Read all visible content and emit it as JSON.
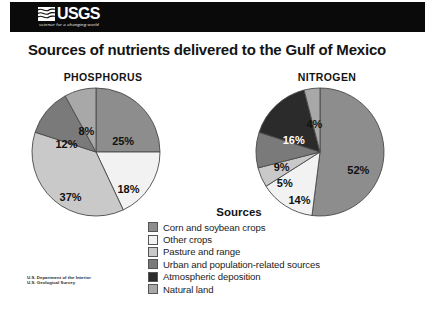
{
  "header": {
    "wordmark": "USGS",
    "tagline": "science for a changing world",
    "logo_icon": "usgs-wave-icon",
    "bar_color": "#0a0a0a"
  },
  "title": "Sources of nutrients delivered to the Gulf of Mexico",
  "legend": {
    "title": "Sources",
    "items": [
      {
        "label": "Corn and soybean crops",
        "color": "#8d8d8d"
      },
      {
        "label": "Other crops",
        "color": "#f2f2f2"
      },
      {
        "label": "Pasture and range",
        "color": "#c9c9c9"
      },
      {
        "label": "Urban and population-related sources",
        "color": "#7a7a7a"
      },
      {
        "label": "Atmospheric deposition",
        "color": "#2b2b2b"
      },
      {
        "label": "Natural land",
        "color": "#a8a8a8"
      }
    ]
  },
  "footer": {
    "line1": "U.S. Department of the Interior",
    "line2": "U.S. Geological Survey"
  },
  "chart_data": [
    {
      "type": "pie",
      "title": "PHOSPHORUS",
      "categories": [
        "Corn and soybean crops",
        "Other crops",
        "Pasture and range",
        "Urban and population-related sources",
        "Atmospheric deposition"
      ],
      "values": [
        25,
        18,
        37,
        12,
        8
      ],
      "labels": [
        "25%",
        "18%",
        "37%",
        "12%",
        "8%"
      ],
      "colors": [
        "#8d8d8d",
        "#f2f2f2",
        "#c9c9c9",
        "#7a7a7a",
        "#a8a8a8"
      ],
      "start_angle": 0,
      "legend_position": "bottom-shared",
      "grid": false
    },
    {
      "type": "pie",
      "title": "NITROGEN",
      "categories": [
        "Corn and soybean crops",
        "Other crops",
        "Pasture and range",
        "Urban and population-related sources",
        "Atmospheric deposition",
        "Natural land"
      ],
      "values": [
        52,
        14,
        5,
        9,
        16,
        4
      ],
      "labels": [
        "52%",
        "14%",
        "5%",
        "9%",
        "16%",
        "4%"
      ],
      "colors": [
        "#8d8d8d",
        "#f2f2f2",
        "#c9c9c9",
        "#7a7a7a",
        "#2b2b2b",
        "#a8a8a8"
      ],
      "start_angle": 0,
      "legend_position": "bottom-shared",
      "grid": false
    }
  ]
}
